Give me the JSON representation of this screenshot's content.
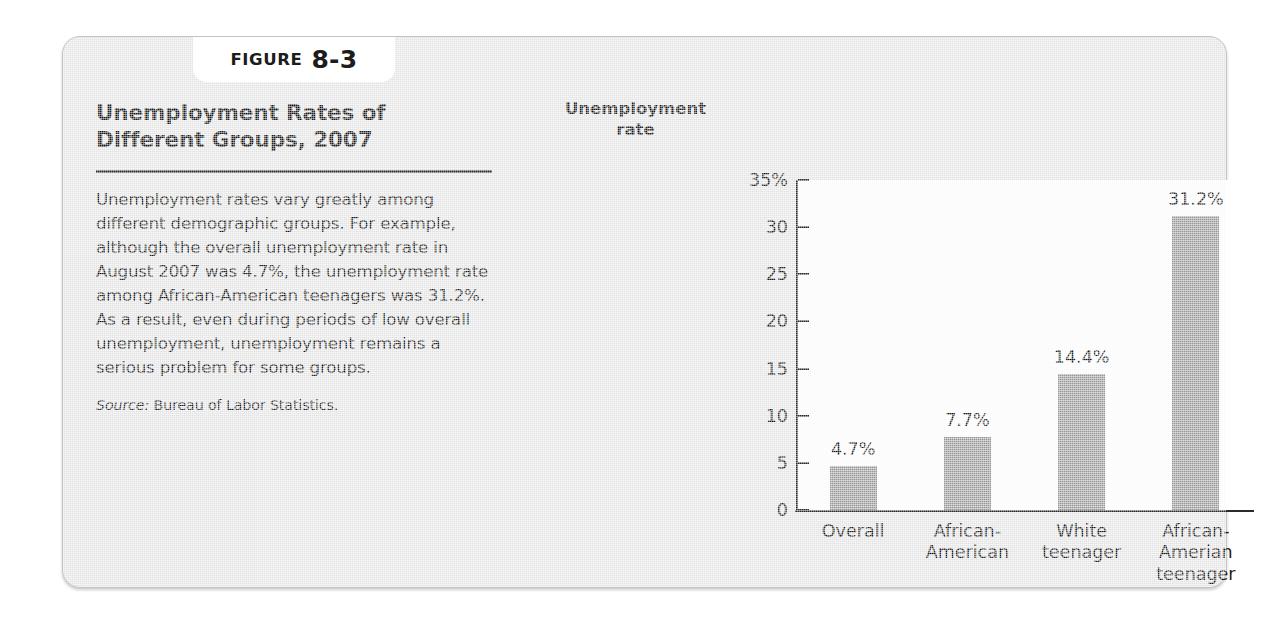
{
  "figure": {
    "tab_word": "FIGURE",
    "tab_number": "8-3",
    "title": "Unemployment Rates of Different Groups, 2007",
    "body": "Unemployment rates vary greatly among different demographic groups. For example, although the overall unemployment rate in August 2007 was 4.7%, the unemployment rate among African-American teenagers was 31.2%. As a result, even during periods of low overall unemployment, unemployment remains a serious problem for some groups.",
    "source_label": "Source:",
    "source_text": "Bureau of Labor Statistics."
  },
  "colors": {
    "panel_background": "#e8e8e8",
    "plot_background": "#ffffff",
    "bar_fill": "#9b9b9b",
    "axis": "#2b2b2b",
    "text": "#1b1b1b"
  },
  "chart_data": {
    "type": "bar",
    "title": "Unemployment Rates of Different Groups, 2007",
    "ylabel": "Unemployment rate",
    "xlabel": "",
    "ylim": [
      0,
      35
    ],
    "grid": false,
    "legend": "none",
    "ytick_labels": [
      "35%",
      "30",
      "25",
      "20",
      "15",
      "10",
      "5",
      "0"
    ],
    "ytick_values": [
      35,
      30,
      25,
      20,
      15,
      10,
      5,
      0
    ],
    "categories": [
      "Overall",
      "African-American",
      "White teenager",
      "African-Amerian teenager"
    ],
    "category_lines": [
      [
        "Overall"
      ],
      [
        "African-",
        "American"
      ],
      [
        "White",
        "teenager"
      ],
      [
        "African-",
        "Amerian",
        "teenager"
      ]
    ],
    "values": [
      4.7,
      7.7,
      14.4,
      31.2
    ],
    "value_labels": [
      "4.7%",
      "7.7%",
      "14.4%",
      "31.2%"
    ]
  }
}
